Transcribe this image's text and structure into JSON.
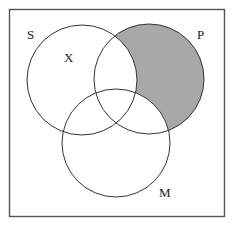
{
  "diagram": {
    "type": "venn",
    "universe_box": {
      "x": 9,
      "y": 9,
      "width": 216,
      "height": 208,
      "stroke": "#555555"
    },
    "circles": [
      {
        "id": "S",
        "label": "S",
        "cx": 82,
        "cy": 80,
        "r": 55
      },
      {
        "id": "P",
        "label": "P",
        "cx": 149,
        "cy": 79,
        "r": 55
      },
      {
        "id": "M",
        "label": "M",
        "cx": 116,
        "cy": 143,
        "r": 54
      }
    ],
    "labels": {
      "S": "S",
      "P": "P",
      "M": "M",
      "X": "X"
    },
    "shaded_region": "P only (P minus S minus M)",
    "shade_color": "#a8a8a8",
    "stroke_color": "#333333",
    "marked_region": {
      "mark": "X",
      "region": "S only (S minus P minus M)"
    }
  }
}
